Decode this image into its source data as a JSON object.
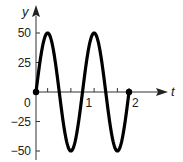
{
  "chart_data": {
    "type": "line",
    "title": "",
    "xlabel": "t",
    "ylabel": "y",
    "function": "y = 50 sin(2πt)",
    "xlim": [
      0,
      2
    ],
    "ylim": [
      -50,
      50
    ],
    "x_ticks": [
      0.25,
      0.5,
      0.75,
      1,
      1.25,
      1.5,
      1.75,
      2
    ],
    "x_tick_labels": [
      {
        "value": 0,
        "label": "0"
      },
      {
        "value": 1,
        "label": "1"
      },
      {
        "value": 2,
        "label": "2"
      }
    ],
    "y_ticks": [
      -50,
      -25,
      25,
      50
    ],
    "y_tick_labels": [
      {
        "value": 50,
        "label": "50"
      },
      {
        "value": 25,
        "label": "25"
      },
      {
        "value": -25,
        "label": "−25"
      },
      {
        "value": -50,
        "label": "−50"
      }
    ],
    "grid": false,
    "legend": null,
    "series": [
      {
        "name": "y",
        "amplitude": 50,
        "period": 1,
        "x": [
          0,
          0.25,
          0.5,
          0.75,
          1,
          1.25,
          1.5,
          1.75,
          2
        ],
        "values": [
          0,
          50,
          0,
          -50,
          0,
          50,
          0,
          -50,
          0
        ]
      }
    ],
    "endpoints": [
      {
        "x": 0,
        "y": 0
      },
      {
        "x": 2,
        "y": 0
      }
    ],
    "colors": {
      "curve": "#000000",
      "axis": "#333333"
    }
  }
}
